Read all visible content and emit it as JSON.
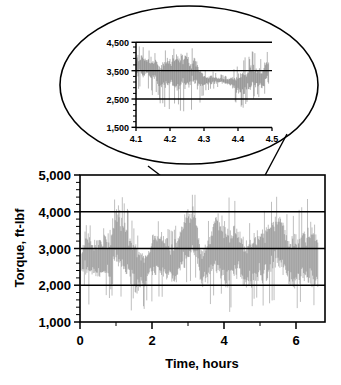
{
  "figure": {
    "background_color": "#ffffff",
    "line_color": "#000000",
    "data_color": "#454545"
  },
  "chart_data": [
    {
      "id": "main",
      "type": "line",
      "title": "",
      "subtitle": "",
      "xlabel": "Time, hours",
      "ylabel": "Torque, ft-lbf",
      "xlim": [
        0,
        6.8
      ],
      "ylim": [
        1000,
        5000
      ],
      "xticks": [
        0,
        2,
        4,
        6
      ],
      "xtick_labels": [
        "0",
        "2",
        "4",
        "6"
      ],
      "yticks": [
        1000,
        2000,
        3000,
        4000,
        5000
      ],
      "ytick_labels": [
        "1,000",
        "2,000",
        "3,000",
        "4,000",
        "5,000"
      ],
      "grid": true,
      "gridlines_y": [
        2000,
        3000,
        4000
      ],
      "legend": "none",
      "minor_ticks_y": true,
      "series": [
        {
          "name": "Drillstring torque",
          "description": "High-frequency stick-slip torque oscillation, dense noise band",
          "x_start": 0.05,
          "x_end": 6.6,
          "sample_count": 900,
          "envelope": [
            {
              "x": 0.05,
              "low": 1900,
              "high": 3000
            },
            {
              "x": 0.2,
              "low": 1450,
              "high": 3700
            },
            {
              "x": 0.4,
              "low": 1500,
              "high": 3400
            },
            {
              "x": 0.6,
              "low": 1500,
              "high": 3500
            },
            {
              "x": 0.8,
              "low": 1400,
              "high": 3500
            },
            {
              "x": 1.0,
              "low": 1400,
              "high": 4450
            },
            {
              "x": 1.2,
              "low": 1250,
              "high": 4300
            },
            {
              "x": 1.4,
              "low": 1150,
              "high": 3800
            },
            {
              "x": 1.6,
              "low": 1020,
              "high": 3300
            },
            {
              "x": 1.8,
              "low": 1350,
              "high": 3000
            },
            {
              "x": 2.0,
              "low": 1450,
              "high": 3600
            },
            {
              "x": 2.2,
              "low": 1500,
              "high": 3700
            },
            {
              "x": 2.4,
              "low": 1500,
              "high": 3500
            },
            {
              "x": 2.6,
              "low": 1450,
              "high": 3400
            },
            {
              "x": 2.8,
              "low": 1600,
              "high": 4000
            },
            {
              "x": 3.0,
              "low": 1900,
              "high": 4400
            },
            {
              "x": 3.2,
              "low": 1950,
              "high": 4400
            },
            {
              "x": 3.35,
              "low": 1400,
              "high": 3300
            },
            {
              "x": 3.5,
              "low": 1500,
              "high": 3400
            },
            {
              "x": 3.7,
              "low": 1400,
              "high": 4400
            },
            {
              "x": 3.9,
              "low": 1350,
              "high": 4400
            },
            {
              "x": 4.05,
              "low": 1000,
              "high": 4400
            },
            {
              "x": 4.2,
              "low": 1500,
              "high": 4350
            },
            {
              "x": 4.4,
              "low": 1600,
              "high": 4100
            },
            {
              "x": 4.6,
              "low": 1250,
              "high": 3600
            },
            {
              "x": 4.8,
              "low": 1300,
              "high": 3800
            },
            {
              "x": 5.0,
              "low": 1400,
              "high": 3900
            },
            {
              "x": 5.2,
              "low": 1350,
              "high": 4000
            },
            {
              "x": 5.4,
              "low": 1500,
              "high": 4350
            },
            {
              "x": 5.6,
              "low": 1400,
              "high": 4300
            },
            {
              "x": 5.8,
              "low": 1250,
              "high": 3700
            },
            {
              "x": 6.0,
              "low": 1200,
              "high": 3900
            },
            {
              "x": 6.2,
              "low": 1300,
              "high": 4100
            },
            {
              "x": 6.4,
              "low": 1250,
              "high": 4400
            },
            {
              "x": 6.6,
              "low": 1350,
              "high": 4200
            }
          ]
        }
      ]
    },
    {
      "id": "inset",
      "type": "line",
      "title": "",
      "xlabel": "",
      "ylabel": "",
      "xlim": [
        4.1,
        4.5
      ],
      "ylim": [
        1500,
        4500
      ],
      "xticks": [
        4.1,
        4.2,
        4.3,
        4.4,
        4.5
      ],
      "xtick_labels": [
        "4.1",
        "4.2",
        "4.3",
        "4.4",
        "4.5"
      ],
      "yticks": [
        1500,
        2500,
        3500,
        4500
      ],
      "ytick_labels": [
        "1,500",
        "2,500",
        "3,500",
        "4,500"
      ],
      "grid": true,
      "gridlines_y": [
        2500,
        3500,
        4500
      ],
      "legend": "none",
      "minor_ticks_y": true,
      "series": [
        {
          "name": "Drillstring torque (zoom 4.1-4.5 h)",
          "description": "Magnified stick-slip detail showing individual oscillation cycles",
          "x_start": 4.1,
          "x_end": 4.49,
          "sample_count": 420,
          "envelope": [
            {
              "x": 4.1,
              "low": 2650,
              "high": 4250
            },
            {
              "x": 4.115,
              "low": 2750,
              "high": 4350
            },
            {
              "x": 4.13,
              "low": 2700,
              "high": 4200
            },
            {
              "x": 4.145,
              "low": 2600,
              "high": 4150
            },
            {
              "x": 4.16,
              "low": 2450,
              "high": 4050
            },
            {
              "x": 4.17,
              "low": 2150,
              "high": 3800
            },
            {
              "x": 4.185,
              "low": 2000,
              "high": 4150
            },
            {
              "x": 4.2,
              "low": 1950,
              "high": 4250
            },
            {
              "x": 4.215,
              "low": 1800,
              "high": 4200
            },
            {
              "x": 4.23,
              "low": 1750,
              "high": 4400
            },
            {
              "x": 4.245,
              "low": 1850,
              "high": 4450
            },
            {
              "x": 4.26,
              "low": 2100,
              "high": 4200
            },
            {
              "x": 4.275,
              "low": 2150,
              "high": 4300
            },
            {
              "x": 4.29,
              "low": 2400,
              "high": 3800
            },
            {
              "x": 4.305,
              "low": 2800,
              "high": 3450
            },
            {
              "x": 4.32,
              "low": 2850,
              "high": 3500
            },
            {
              "x": 4.335,
              "low": 2900,
              "high": 3400
            },
            {
              "x": 4.35,
              "low": 2950,
              "high": 3350
            },
            {
              "x": 4.365,
              "low": 2900,
              "high": 3300
            },
            {
              "x": 4.38,
              "low": 2800,
              "high": 3450
            },
            {
              "x": 4.395,
              "low": 2350,
              "high": 3650
            },
            {
              "x": 4.41,
              "low": 2150,
              "high": 4000
            },
            {
              "x": 4.425,
              "low": 2400,
              "high": 3900
            },
            {
              "x": 4.44,
              "low": 2500,
              "high": 4150
            },
            {
              "x": 4.455,
              "low": 2600,
              "high": 4050
            },
            {
              "x": 4.47,
              "low": 2400,
              "high": 3950
            },
            {
              "x": 4.485,
              "low": 2700,
              "high": 4250
            }
          ]
        }
      ]
    }
  ],
  "callout": {
    "shape": "ellipse",
    "leader_lines": [
      {
        "from_x": 148,
        "from_y": 166,
        "to_x": 211,
        "to_y": 214
      },
      {
        "from_x": 286,
        "from_y": 135,
        "to_x": 245,
        "to_y": 213
      }
    ]
  }
}
